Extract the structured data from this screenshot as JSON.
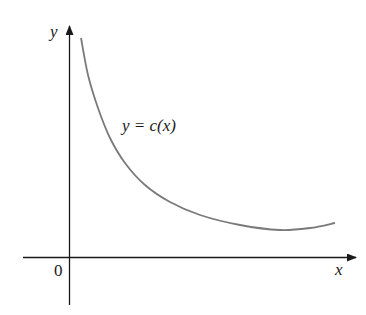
{
  "chart_data": {
    "type": "line",
    "title": "",
    "xlabel": "x",
    "ylabel": "y",
    "origin_label": "0",
    "series": [
      {
        "name": "y = c(x)",
        "description": "Decreasing convex curve approaching a minimum then slightly rising",
        "points_px": [
          [
            81,
            38
          ],
          [
            88,
            75
          ],
          [
            98,
            108
          ],
          [
            110,
            138
          ],
          [
            125,
            163
          ],
          [
            145,
            185
          ],
          [
            170,
            202
          ],
          [
            200,
            215
          ],
          [
            240,
            225
          ],
          [
            280,
            230
          ],
          [
            310,
            228
          ],
          [
            335,
            223
          ]
        ]
      }
    ],
    "annotations": [
      {
        "text": "y = c(x)",
        "x_px": 122,
        "y_px": 132
      }
    ],
    "grid": false,
    "legend": "none",
    "colors": {
      "curve": "#7a7a7a",
      "axes": "#1a1a1a"
    }
  },
  "labels": {
    "y_axis": "y",
    "x_axis": "x",
    "origin": "0",
    "curve": "y = c(x)"
  }
}
